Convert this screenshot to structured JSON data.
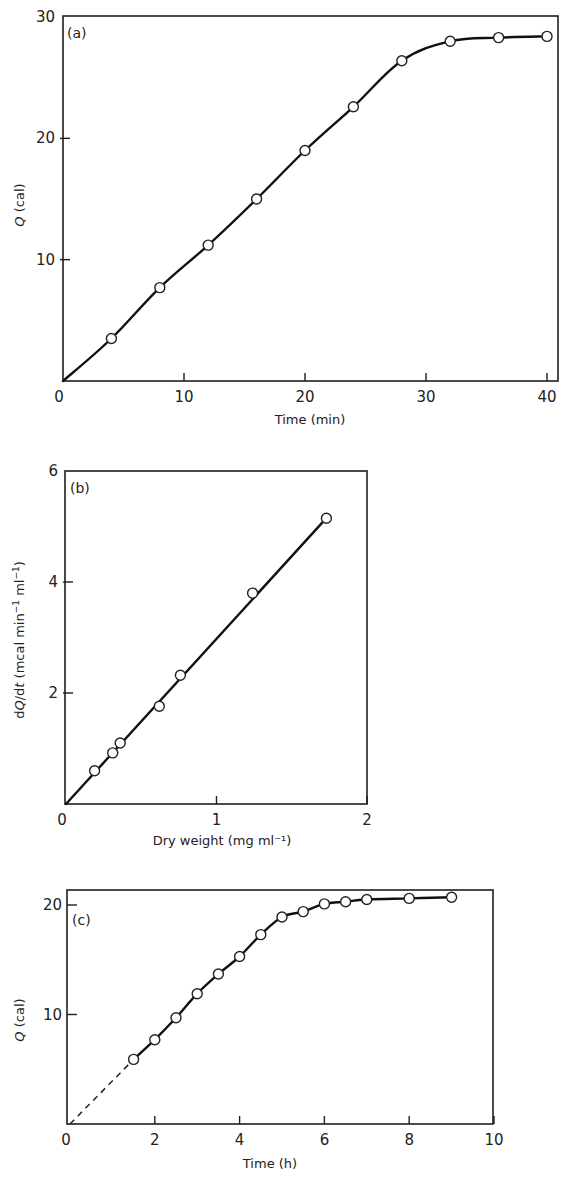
{
  "figure": {
    "panels": [
      "a",
      "b",
      "c"
    ]
  },
  "chart_data": [
    {
      "id": "a",
      "type": "line",
      "panel_label": "(a)",
      "title": "",
      "xlabel": "Time (min)",
      "ylabel": "Q (cal)",
      "xlim": [
        0,
        41
      ],
      "ylim": [
        0,
        30
      ],
      "xticks": [
        0,
        10,
        20,
        30,
        40
      ],
      "yticks": [
        0,
        10,
        20,
        30
      ],
      "xtick_labels": [
        "0",
        "10",
        "20",
        "30",
        "40"
      ],
      "ytick_labels": [
        "0",
        "10",
        "20",
        "30"
      ],
      "grid": false,
      "legend": null,
      "series": [
        {
          "name": "Q",
          "marker": "open-circle",
          "line": "solid smooth curve through origin",
          "x": [
            4,
            8,
            12,
            16,
            20,
            24,
            28,
            32,
            36,
            40
          ],
          "y": [
            3.5,
            7.7,
            11.2,
            15.0,
            19.0,
            22.6,
            26.4,
            28.0,
            28.3,
            28.4
          ]
        }
      ]
    },
    {
      "id": "b",
      "type": "line",
      "panel_label": "(b)",
      "title": "",
      "xlabel": "Dry weight (mg ml⁻¹)",
      "ylabel": "dQ/dt (mcal min⁻¹ ml⁻¹)",
      "xlim": [
        0,
        2
      ],
      "ylim": [
        0,
        6
      ],
      "xticks": [
        0,
        1,
        2
      ],
      "yticks": [
        0,
        2,
        4,
        6
      ],
      "xtick_labels": [
        "0",
        "1",
        "2"
      ],
      "ytick_labels": [
        "0",
        "2",
        "4",
        "6"
      ],
      "grid": false,
      "legend": null,
      "series": [
        {
          "name": "dQ/dt",
          "marker": "open-circle",
          "line": "solid straight line through origin",
          "x": [
            0.19,
            0.31,
            0.36,
            0.62,
            0.76,
            1.24,
            1.73
          ],
          "y": [
            0.6,
            0.92,
            1.1,
            1.76,
            2.32,
            3.8,
            5.15
          ]
        }
      ]
    },
    {
      "id": "c",
      "type": "line",
      "panel_label": "(c)",
      "title": "",
      "xlabel": "Time (h)",
      "ylabel": "Q (cal)",
      "xlim": [
        0,
        10
      ],
      "ylim": [
        0,
        21
      ],
      "xticks": [
        0,
        2,
        4,
        6,
        8,
        10
      ],
      "yticks": [
        0,
        10,
        20
      ],
      "xtick_labels": [
        "0",
        "2",
        "4",
        "6",
        "8",
        "10"
      ],
      "ytick_labels": [
        "0",
        "10",
        "20"
      ],
      "grid": false,
      "legend": null,
      "annotations": [
        "dashed extrapolation from origin to first point (1.5 h)"
      ],
      "series": [
        {
          "name": "Q",
          "marker": "open-circle",
          "line": "solid curve; dashed extrapolation to origin",
          "x": [
            1.5,
            2,
            2.5,
            3,
            3.5,
            4,
            4.5,
            5,
            5.5,
            6,
            6.5,
            7,
            8,
            9
          ],
          "y": [
            5.9,
            7.7,
            9.7,
            11.9,
            13.7,
            15.3,
            17.3,
            18.9,
            19.4,
            20.1,
            20.3,
            20.5,
            20.6,
            20.7
          ]
        }
      ]
    }
  ]
}
